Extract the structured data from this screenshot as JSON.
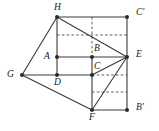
{
  "figure": {
    "width": 159,
    "height": 131,
    "background_color": "#ffffff",
    "line_color": "#3a3a3a",
    "dashed_line_color": "#4a4a4a",
    "vertex_color": "#2b2b2b"
  },
  "vertices": [
    {
      "id": "H",
      "label": "H",
      "x": 57,
      "y": 17,
      "label_x": 54,
      "label_y": 3,
      "dot": true
    },
    {
      "id": "Cp",
      "label": "C′",
      "x": 127,
      "y": 17,
      "label_x": 136,
      "label_y": 8,
      "dot": true
    },
    {
      "id": "A",
      "label": "A",
      "x": 57,
      "y": 57,
      "label_x": 44,
      "label_y": 52,
      "dot": true
    },
    {
      "id": "B",
      "label": "B",
      "x": 92,
      "y": 57,
      "label_x": 94,
      "label_y": 44,
      "dot": true
    },
    {
      "id": "E",
      "label": "E",
      "x": 127,
      "y": 57,
      "label_x": 136,
      "label_y": 50,
      "dot": true
    },
    {
      "id": "G",
      "label": "G",
      "x": 22,
      "y": 75,
      "label_x": 7,
      "label_y": 70,
      "dot": true
    },
    {
      "id": "D",
      "label": "D",
      "x": 57,
      "y": 75,
      "label_x": 54,
      "label_y": 78,
      "dot": true
    },
    {
      "id": "C",
      "label": "C",
      "x": 92,
      "y": 75,
      "label_x": 94,
      "label_y": 62,
      "dot": true
    },
    {
      "id": "F",
      "label": "F",
      "x": 92,
      "y": 110,
      "label_x": 89,
      "label_y": 113,
      "dot": true
    },
    {
      "id": "Bp",
      "label": "B′",
      "x": 127,
      "y": 110,
      "label_x": 136,
      "label_y": 103,
      "dot": true
    }
  ],
  "solid_edges": [
    {
      "name": "edge-H-Cprime",
      "from": "H",
      "to": "Cp"
    },
    {
      "name": "edge-H-E",
      "from": "H",
      "to": "E"
    },
    {
      "name": "edge-H-G",
      "from": "H",
      "to": "G"
    },
    {
      "name": "edge-H-A",
      "from": "H",
      "to": "A"
    },
    {
      "name": "edge-A-D",
      "from": "A",
      "to": "D"
    },
    {
      "name": "edge-A-B",
      "from": "A",
      "to": "B"
    },
    {
      "name": "edge-B-E",
      "from": "B",
      "to": "E"
    },
    {
      "name": "edge-G-D",
      "from": "G",
      "to": "D"
    },
    {
      "name": "edge-D-C",
      "from": "D",
      "to": "C"
    },
    {
      "name": "edge-C-E",
      "from": "C",
      "to": "E"
    },
    {
      "name": "edge-G-F",
      "from": "G",
      "to": "F"
    },
    {
      "name": "edge-B-C",
      "from": "B",
      "to": "C"
    },
    {
      "name": "edge-C-F",
      "from": "C",
      "to": "F"
    },
    {
      "name": "edge-F-E",
      "from": "F",
      "to": "E"
    },
    {
      "name": "edge-F-Bprime",
      "from": "F",
      "to": "Bp"
    },
    {
      "name": "edge-E-Bprime",
      "from": "E",
      "to": "Bp"
    },
    {
      "name": "edge-Cprime-E",
      "from": "Cp",
      "to": "E"
    }
  ],
  "dashed_edges": [
    {
      "name": "dashed-upper-horizontal",
      "x1": 57,
      "y1": 35,
      "x2": 127,
      "y2": 35
    },
    {
      "name": "dashed-vertical-through-B",
      "x1": 92,
      "y1": 17,
      "x2": 92,
      "y2": 57
    },
    {
      "name": "dashed-C-to-right-edge",
      "x1": 92,
      "y1": 75,
      "x2": 127,
      "y2": 75
    },
    {
      "name": "dashed-lower-horizontal",
      "x1": 92,
      "y1": 92,
      "x2": 127,
      "y2": 92
    }
  ]
}
